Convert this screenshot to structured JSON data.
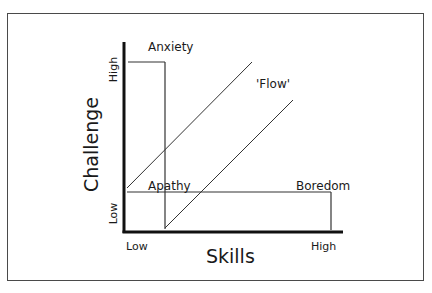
{
  "diagram": {
    "x_axis": {
      "title": "Skills",
      "low_label": "Low",
      "high_label": "High"
    },
    "y_axis": {
      "title": "Challenge",
      "low_label": "Low",
      "high_label": "High"
    },
    "regions": {
      "anxiety": "Anxiety",
      "flow": "'Flow'",
      "apathy": "Apathy",
      "boredom": "Boredom"
    },
    "colors": {
      "axis": "#111111",
      "line": "#333333",
      "frame": "#4a4a4a",
      "background": "#ffffff"
    }
  }
}
